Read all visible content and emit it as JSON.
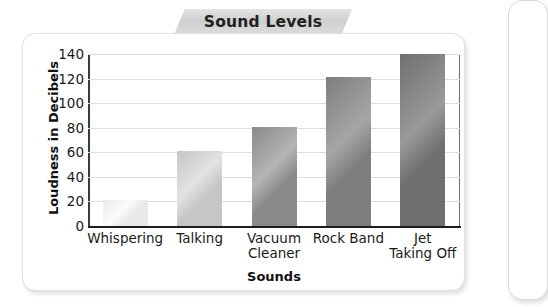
{
  "title": "Sound Levels",
  "card": {
    "background": "#ffffff",
    "border_color": "#e0e0e0"
  },
  "banner": {
    "color_light": "#e4e4e4",
    "color_dark": "#cfcfcf"
  },
  "chart_data": {
    "type": "bar",
    "title": "Sound Levels",
    "xlabel": "Sounds",
    "ylabel": "Loudness in Decibels",
    "categories": [
      "Whispering",
      "Talking",
      "Vacuum Cleaner",
      "Rock Band",
      "Jet Taking Off"
    ],
    "category_lines": [
      [
        "Whispering"
      ],
      [
        "Talking"
      ],
      [
        "Vacuum",
        "Cleaner"
      ],
      [
        "Rock Band"
      ],
      [
        "Jet",
        "Taking Off"
      ]
    ],
    "values": [
      21,
      61,
      81,
      121,
      141
    ],
    "ylim": [
      0,
      140
    ],
    "yticks": [
      0,
      20,
      40,
      60,
      80,
      100,
      120,
      140
    ],
    "ytick_labels": [
      "0",
      "20",
      "40",
      "60",
      "80",
      "100",
      "120",
      "140"
    ],
    "grid": true,
    "grid_color": "#dcdcdc",
    "legend": "none",
    "bar_colors": [
      "#e9e9e9",
      "#c6c6c6",
      "#8a8a8a",
      "#7d7d7d",
      "#6f6f6f"
    ],
    "bar_colors_highlight": [
      "#fbfbfb",
      "#e2e2e2",
      "#b4b4b4",
      "#a6a6a6",
      "#9a9a9a"
    ]
  }
}
